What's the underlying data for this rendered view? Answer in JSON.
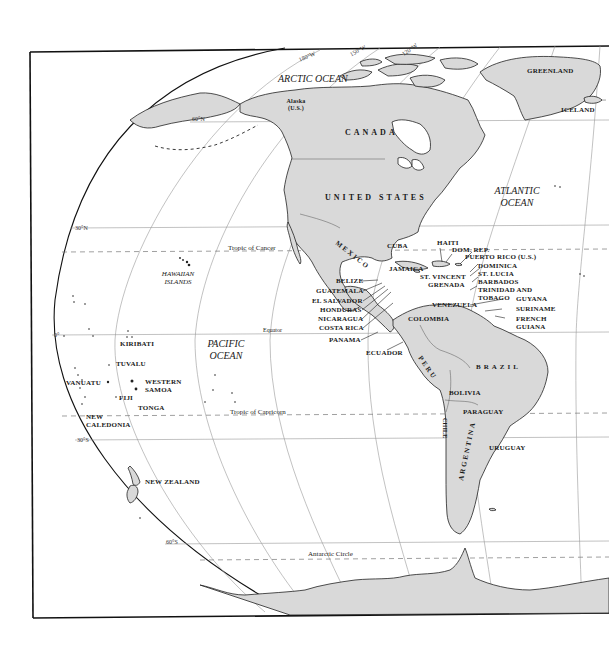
{
  "map": {
    "colors": {
      "land": "#d9d9d9",
      "water": "#ffffff",
      "coast": "#222222",
      "grid": "#888888",
      "frame": "#111111"
    },
    "graticule": {
      "meridians": [
        "180°W",
        "150°W",
        "120°W"
      ],
      "parallels": [
        "60°N",
        "30°N",
        "0°",
        "30°S",
        "60°S"
      ]
    },
    "special_lines": {
      "tropic_cancer": "Tropic of Cancer",
      "equator": "Equator",
      "tropic_capricorn": "Tropic of Capricorn",
      "antarctic_circle": "Antarctic Circle"
    },
    "oceans": {
      "arctic": "ARCTIC OCEAN",
      "atlantic_1": "ATLANTIC",
      "atlantic_2": "OCEAN",
      "pacific_1": "PACIFIC",
      "pacific_2": "OCEAN",
      "hawaii_1": "HAWAIIAN",
      "hawaii_2": "ISLANDS"
    },
    "north_america": {
      "alaska_1": "Alaska",
      "alaska_2": "(U.S.)",
      "canada": "CANADA",
      "usa": "UNITED STATES",
      "greenland": "GREENLAND",
      "iceland": "ICELAND",
      "mexico": "MEXICO"
    },
    "central_america": {
      "belize": "BELIZE",
      "guatemala": "GUATEMALA",
      "el_salvador": "EL SALVADOR",
      "honduras": "HONDURAS",
      "nicaragua": "NICARAGUA",
      "costa_rica": "COSTA RICA",
      "panama": "PANAMA"
    },
    "caribbean": {
      "cuba": "CUBA",
      "jamaica": "JAMAICA",
      "haiti": "HAITI",
      "dom_rep": "DOM. REP.",
      "puerto_rico": "PUERTO RICO (U.S.)",
      "dominica": "DOMINICA",
      "st_lucia": "ST. LUCIA",
      "barbados": "BARBADOS",
      "st_vincent": "ST. VINCENT",
      "grenada": "GRENADA",
      "trinidad_1": "TRINIDAD AND",
      "trinidad_2": "TOBAGO"
    },
    "south_america": {
      "venezuela": "VENEZUELA",
      "colombia": "COLOMBIA",
      "guyana": "GUYANA",
      "suriname": "SURINAME",
      "french_guiana_1": "FRENCH",
      "french_guiana_2": "GUIANA",
      "ecuador": "ECUADOR",
      "peru": "PERU",
      "brazil": "BRAZIL",
      "bolivia": "BOLIVIA",
      "paraguay": "PARAGUAY",
      "chile": "CHILE",
      "argentina": "ARGENTINA",
      "uruguay": "URUGUAY"
    },
    "oceania": {
      "kiribati": "KIRIBATI",
      "tuvalu": "TUVALU",
      "vanuatu": "VANUATU",
      "fiji": "FIJI",
      "western_samoa_1": "WESTERN",
      "western_samoa_2": "SAMOA",
      "tonga": "TONGA",
      "new_caledonia_1": "NEW",
      "new_caledonia_2": "CALEDONIA",
      "new_zealand": "NEW ZEALAND"
    }
  }
}
